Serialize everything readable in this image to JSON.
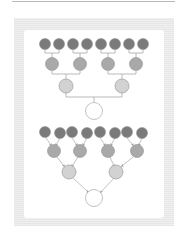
{
  "diagram": {
    "colors": {
      "leaf": "#7a7a7a",
      "level2": "#a9a9a9",
      "level3": "#d2d2d2",
      "root": "#ffffff",
      "stroke": "#9a9a9a",
      "frame": "#ececec"
    },
    "trees": [
      {
        "style": "orthogonal-connectors",
        "levels": [
          8,
          4,
          2,
          1
        ]
      },
      {
        "style": "diagonal-arrows",
        "levels": [
          8,
          4,
          2,
          1
        ]
      }
    ]
  }
}
